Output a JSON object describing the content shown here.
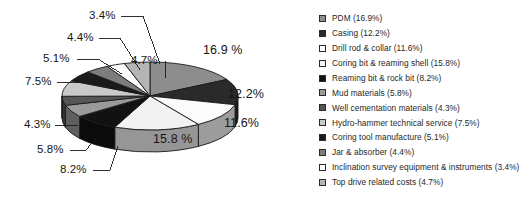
{
  "chart_data": {
    "type": "pie",
    "title": "",
    "subtitle": "",
    "xlabel": "",
    "ylabel": "",
    "units": "percent",
    "three_d": true,
    "grid": false,
    "legend_position": "right",
    "palette": "grayscale",
    "categories": [
      "PDM",
      "Casing",
      "Drill rod & collar",
      "Coring bit & reaming shell",
      "Reaming bit & rock bit",
      "Mud materials",
      "Well cementation materials",
      "Hydro-hammer technical service",
      "Coring tool manufacture",
      "Jar & absorber",
      "Inclination survey equipment & instruments",
      "Top drive related costs"
    ],
    "values": [
      16.9,
      12.2,
      11.6,
      15.8,
      8.2,
      5.8,
      4.3,
      7.5,
      5.1,
      4.4,
      3.4,
      4.7
    ],
    "colors": [
      "#8d8d8d",
      "#2a2a2a",
      "#fbfbfb",
      "#f2f2f2",
      "#121212",
      "#9a9a9a",
      "#565656",
      "#c9c9c9",
      "#1a1a1a",
      "#7d7d7d",
      "#fdfdfd",
      "#b5b5b5"
    ],
    "slice_labels": [
      "16.9 %",
      "12.2%",
      "11.6%",
      "15.8 %",
      "8.2%",
      "5.8%",
      "4.3%",
      "7.5%",
      "5.1%",
      "4.4%",
      "3.4%",
      "4.7%"
    ]
  },
  "legend": {
    "items": [
      {
        "label": "PDM (16.9%)",
        "color": "#8d8d8d"
      },
      {
        "label": "Casing (12.2%)",
        "color": "#2a2a2a"
      },
      {
        "label": "Drill rod & collar (11.6%)",
        "color": "#fbfbfb"
      },
      {
        "label": "Coring bit & reaming shell (15.8%)",
        "color": "#f2f2f2"
      },
      {
        "label": "Reaming bit & rock bit (8.2%)",
        "color": "#121212"
      },
      {
        "label": "Mud materials (5.8%)",
        "color": "#9a9a9a"
      },
      {
        "label": "Well cementation materials (4.3%)",
        "color": "#565656"
      },
      {
        "label": "Hydro-hammer technical service (7.5%)",
        "color": "#c9c9c9"
      },
      {
        "label": "Coring tool manufacture (5.1%)",
        "color": "#1a1a1a"
      },
      {
        "label": "Jar & absorber (4.4%)",
        "color": "#7d7d7d"
      },
      {
        "label": "Inclination survey equipment & instruments (3.4%)",
        "color": "#fdfdfd"
      },
      {
        "label": "Top drive related costs (4.7%)",
        "color": "#b5b5b5"
      }
    ]
  },
  "callouts": {
    "pdm": "16.9 %",
    "casing": "12.2%",
    "drill_rod": "11.6%",
    "coring_bit": "15.8 %",
    "reaming": "8.2%",
    "mud": "5.8%",
    "cementation": "4.3%",
    "hydro": "7.5%",
    "coring_tool": "5.1%",
    "jar": "4.4%",
    "inclination": "3.4%",
    "top_drive": "4.7%"
  }
}
